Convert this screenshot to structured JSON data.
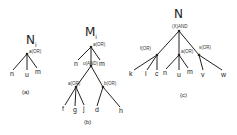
{
  "diagrams": {
    "a": {
      "title": "N",
      "title_sub": "i",
      "caption": "(a)",
      "root": "a(OR)",
      "leaves": [
        "n",
        "u",
        "m"
      ]
    },
    "b": {
      "title": "M",
      "title_sub": "i",
      "caption": "(b)",
      "root": "a(OR)",
      "children": [
        "n",
        "u(AND)",
        "m"
      ],
      "sub_nodes": [
        "a(OR)",
        "b(OR)"
      ],
      "a_leaves": [
        "f",
        "g",
        "j"
      ],
      "b_leaves": [
        "d",
        "h"
      ]
    },
    "c": {
      "title": "N",
      "caption": "(c)",
      "root": "(X)AND",
      "children": [
        "f(OR)",
        "a(OR)",
        "s(OR)"
      ],
      "f_leaves": [
        "k",
        "l",
        "c"
      ],
      "a_leaves": [
        "n",
        "u",
        "m"
      ],
      "s_leaves": [
        "v",
        "w"
      ]
    }
  }
}
